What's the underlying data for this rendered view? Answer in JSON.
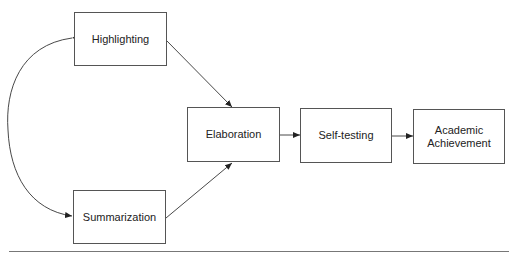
{
  "diagram": {
    "type": "path-model",
    "nodes": [
      {
        "id": "highlighting",
        "label": "Highlighting"
      },
      {
        "id": "summarization",
        "label": "Summarization"
      },
      {
        "id": "elaboration",
        "label": "Elaboration"
      },
      {
        "id": "self_testing",
        "label": "Self-testing"
      },
      {
        "id": "academic_achievement",
        "label": "Academic Achievement",
        "lines": [
          "Academic",
          "Achievement"
        ]
      }
    ],
    "edges": [
      {
        "from": "highlighting",
        "to": "summarization",
        "type": "bidirectional-curved"
      },
      {
        "from": "highlighting",
        "to": "elaboration",
        "type": "directed"
      },
      {
        "from": "summarization",
        "to": "elaboration",
        "type": "directed"
      },
      {
        "from": "elaboration",
        "to": "self_testing",
        "type": "directed"
      },
      {
        "from": "self_testing",
        "to": "academic_achievement",
        "type": "directed"
      }
    ]
  }
}
